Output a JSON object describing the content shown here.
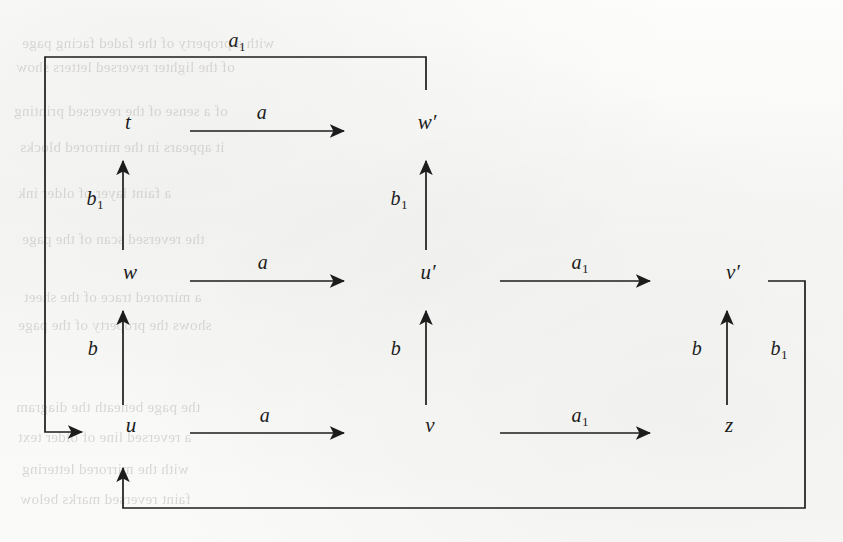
{
  "page": {
    "width": 843,
    "height": 542,
    "background_color": "#fbfbfa",
    "ink_color": "#1c1c1c",
    "kind": "scanned-page-commutative-diagram"
  },
  "diagram": {
    "type": "commutative-diagram",
    "nodes": [
      {
        "id": "t",
        "label": "t",
        "x": 128,
        "y": 122
      },
      {
        "id": "wp",
        "label": "w′",
        "x": 427,
        "y": 122
      },
      {
        "id": "w",
        "label": "w",
        "x": 130,
        "y": 272
      },
      {
        "id": "up",
        "label": "u′",
        "x": 428,
        "y": 272
      },
      {
        "id": "vp",
        "label": "v′",
        "x": 733,
        "y": 272
      },
      {
        "id": "u",
        "label": "u",
        "x": 131,
        "y": 425
      },
      {
        "id": "v",
        "label": "v",
        "x": 430,
        "y": 425
      },
      {
        "id": "z",
        "label": "z",
        "x": 729,
        "y": 425
      }
    ],
    "edges": [
      {
        "id": "t-to-wp",
        "from": "t",
        "to": "wp",
        "label": "a",
        "sub": "",
        "label_x": 262,
        "label_y": 113,
        "direction": "right"
      },
      {
        "id": "w-to-up",
        "from": "w",
        "to": "up",
        "label": "a",
        "sub": "",
        "label_x": 263,
        "label_y": 263,
        "direction": "right"
      },
      {
        "id": "up-to-vp",
        "from": "up",
        "to": "vp",
        "label": "a",
        "sub": "1",
        "label_x": 580,
        "label_y": 263,
        "direction": "right"
      },
      {
        "id": "u-to-v",
        "from": "u",
        "to": "v",
        "label": "a",
        "sub": "",
        "label_x": 265,
        "label_y": 416,
        "direction": "right"
      },
      {
        "id": "v-to-z",
        "from": "v",
        "to": "z",
        "label": "a",
        "sub": "1",
        "label_x": 580,
        "label_y": 416,
        "direction": "right"
      },
      {
        "id": "w-to-t",
        "from": "w",
        "to": "t",
        "label": "b",
        "sub": "1",
        "label_x": 95,
        "label_y": 199,
        "direction": "up"
      },
      {
        "id": "up-to-wp",
        "from": "up",
        "to": "wp",
        "label": "b",
        "sub": "1",
        "label_x": 399,
        "label_y": 199,
        "direction": "up"
      },
      {
        "id": "u-to-w",
        "from": "u",
        "to": "w",
        "label": "b",
        "sub": "",
        "label_x": 93,
        "label_y": 349,
        "direction": "up"
      },
      {
        "id": "v-to-up",
        "from": "v",
        "to": "up",
        "label": "b",
        "sub": "",
        "label_x": 396,
        "label_y": 349,
        "direction": "up"
      },
      {
        "id": "z-to-vp",
        "from": "z",
        "to": "vp",
        "label": "b",
        "sub": "",
        "label_x": 697,
        "label_y": 349,
        "direction": "up"
      },
      {
        "id": "wp-to-u-loop",
        "from": "wp",
        "to": "u",
        "label": "a",
        "sub": "1",
        "label_x": 237,
        "label_y": 41,
        "direction": "loop-top-left"
      },
      {
        "id": "vp-to-u-loop",
        "from": "vp",
        "to": "u",
        "label": "b",
        "sub": "1",
        "label_x": 779,
        "label_y": 349,
        "direction": "loop-bottom-right"
      }
    ],
    "geometry": {
      "col_x": [
        123,
        426,
        727
      ],
      "row_y": [
        131,
        281,
        433
      ],
      "top_loop": {
        "start_x": 426,
        "start_y": 90,
        "top_y": 57,
        "left_x": 45,
        "end_y": 432,
        "arrow_x": 88
      },
      "bottom_loop": {
        "start_x": 805,
        "start_y": 281,
        "corner_x": 805,
        "bottom_y": 508,
        "left_x": 123,
        "arrow_y": 472
      }
    }
  },
  "ghost_text": {
    "note": "faint bleed-through of reversed text from the facing page",
    "lines": [
      {
        "text": "with a property of the faded facing page",
        "x": 22,
        "y": 36,
        "size": 15
      },
      {
        "text": "of the lighter reversed letters show",
        "x": 16,
        "y": 60,
        "size": 15
      },
      {
        "text": "of a sense of the reversed printing",
        "x": 14,
        "y": 104,
        "size": 15
      },
      {
        "text": "it appears in the mirrored blocks",
        "x": 20,
        "y": 140,
        "size": 15
      },
      {
        "text": "a faint layer of older ink",
        "x": 18,
        "y": 186,
        "size": 15
      },
      {
        "text": "the reversed scan of the page",
        "x": 22,
        "y": 232,
        "size": 15
      },
      {
        "text": "a mirrored trace of the sheet",
        "x": 24,
        "y": 290,
        "size": 15
      },
      {
        "text": "shows the property of the page",
        "x": 18,
        "y": 318,
        "size": 15
      },
      {
        "text": "the page beneath the diagram",
        "x": 16,
        "y": 400,
        "size": 15
      },
      {
        "text": "a reversed line of older text",
        "x": 18,
        "y": 430,
        "size": 15
      },
      {
        "text": "with the mirrored lettering",
        "x": 22,
        "y": 462,
        "size": 15
      },
      {
        "text": "faint reversed marks below",
        "x": 20,
        "y": 492,
        "size": 15
      }
    ]
  }
}
